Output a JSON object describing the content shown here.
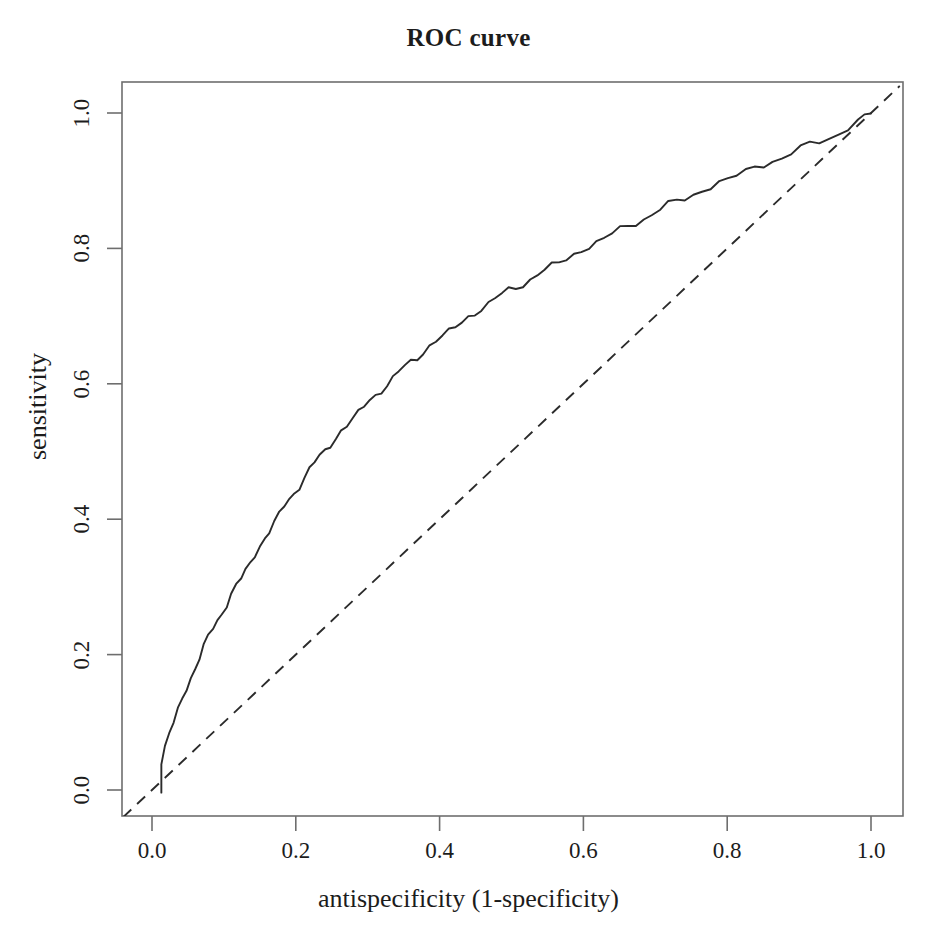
{
  "chart_data": {
    "type": "line",
    "title": "ROC curve",
    "xlabel": "antispecificity (1-specificity)",
    "ylabel": "sensitivity",
    "xlim": [
      0.0,
      1.0
    ],
    "ylim": [
      0.0,
      1.0
    ],
    "grid": false,
    "legend": null,
    "xticks": [
      "0.0",
      "0.2",
      "0.4",
      "0.6",
      "0.8",
      "1.0"
    ],
    "xtick_values": [
      0.0,
      0.2,
      0.4,
      0.6,
      0.8,
      1.0
    ],
    "yticks": [
      "0.0",
      "0.2",
      "0.4",
      "0.6",
      "0.8",
      "1.0"
    ],
    "ytick_values": [
      0.0,
      0.2,
      0.4,
      0.6,
      0.8,
      1.0
    ],
    "series": [
      {
        "name": "ROC curve",
        "style": "solid",
        "color": "#2b2b2b",
        "x": [
          0.013,
          0.013,
          0.018,
          0.024,
          0.03,
          0.036,
          0.042,
          0.048,
          0.054,
          0.06,
          0.066,
          0.072,
          0.078,
          0.085,
          0.091,
          0.097,
          0.104,
          0.11,
          0.117,
          0.124,
          0.13,
          0.137,
          0.143,
          0.15,
          0.157,
          0.163,
          0.17,
          0.177,
          0.184,
          0.191,
          0.198,
          0.205,
          0.212,
          0.219,
          0.226,
          0.233,
          0.241,
          0.248,
          0.256,
          0.263,
          0.271,
          0.279,
          0.287,
          0.295,
          0.303,
          0.311,
          0.319,
          0.327,
          0.335,
          0.343,
          0.352,
          0.36,
          0.369,
          0.377,
          0.386,
          0.395,
          0.404,
          0.413,
          0.422,
          0.431,
          0.44,
          0.449,
          0.458,
          0.468,
          0.477,
          0.487,
          0.496,
          0.506,
          0.516,
          0.526,
          0.536,
          0.546,
          0.556,
          0.566,
          0.576,
          0.587,
          0.597,
          0.608,
          0.618,
          0.629,
          0.64,
          0.651,
          0.662,
          0.673,
          0.684,
          0.695,
          0.707,
          0.718,
          0.73,
          0.741,
          0.753,
          0.765,
          0.777,
          0.789,
          0.801,
          0.813,
          0.826,
          0.838,
          0.851,
          0.863,
          0.876,
          0.889,
          0.902,
          0.915,
          0.928,
          0.941,
          0.955,
          0.968,
          0.982,
          0.991,
          1.0
        ],
        "y": [
          0.0,
          0.042,
          0.062,
          0.082,
          0.1,
          0.118,
          0.134,
          0.15,
          0.166,
          0.181,
          0.196,
          0.211,
          0.224,
          0.238,
          0.251,
          0.263,
          0.276,
          0.288,
          0.3,
          0.312,
          0.324,
          0.336,
          0.348,
          0.36,
          0.372,
          0.383,
          0.395,
          0.406,
          0.418,
          0.429,
          0.44,
          0.451,
          0.462,
          0.472,
          0.482,
          0.492,
          0.502,
          0.511,
          0.521,
          0.53,
          0.539,
          0.548,
          0.557,
          0.566,
          0.575,
          0.583,
          0.592,
          0.6,
          0.608,
          0.616,
          0.624,
          0.632,
          0.64,
          0.648,
          0.656,
          0.663,
          0.67,
          0.677,
          0.684,
          0.691,
          0.698,
          0.705,
          0.712,
          0.719,
          0.725,
          0.731,
          0.737,
          0.743,
          0.749,
          0.755,
          0.761,
          0.767,
          0.773,
          0.779,
          0.785,
          0.791,
          0.797,
          0.803,
          0.809,
          0.815,
          0.821,
          0.827,
          0.833,
          0.839,
          0.845,
          0.851,
          0.857,
          0.863,
          0.869,
          0.874,
          0.88,
          0.886,
          0.891,
          0.897,
          0.902,
          0.908,
          0.913,
          0.919,
          0.924,
          0.93,
          0.935,
          0.941,
          0.946,
          0.952,
          0.957,
          0.963,
          0.971,
          0.979,
          0.988,
          0.994,
          1.0
        ],
        "jitter": true,
        "description": "Empirical ROC curve rising steeply from near the origin, bowed well above the chance diagonal, converging to (1,1)."
      },
      {
        "name": "chance diagonal",
        "style": "dashed",
        "color": "#2b2b2b",
        "x": [
          -0.04,
          1.04
        ],
        "y": [
          -0.04,
          1.04
        ],
        "description": "Reference line of no discrimination (y = x), drawn dashed."
      }
    ],
    "annotations": []
  },
  "axes": {
    "box_color": "#6e6e6e",
    "tick_color": "#6e6e6e"
  }
}
